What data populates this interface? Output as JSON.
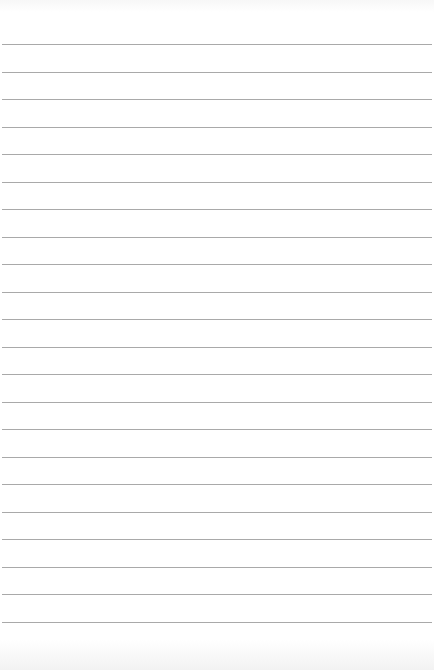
{
  "paper": {
    "type": "lined-notepad-page",
    "background_color": "#ffffff",
    "line_color": "#a9a9a9",
    "line_count": 22,
    "first_line_y": 44,
    "line_spacing": 27.5,
    "text": ""
  }
}
